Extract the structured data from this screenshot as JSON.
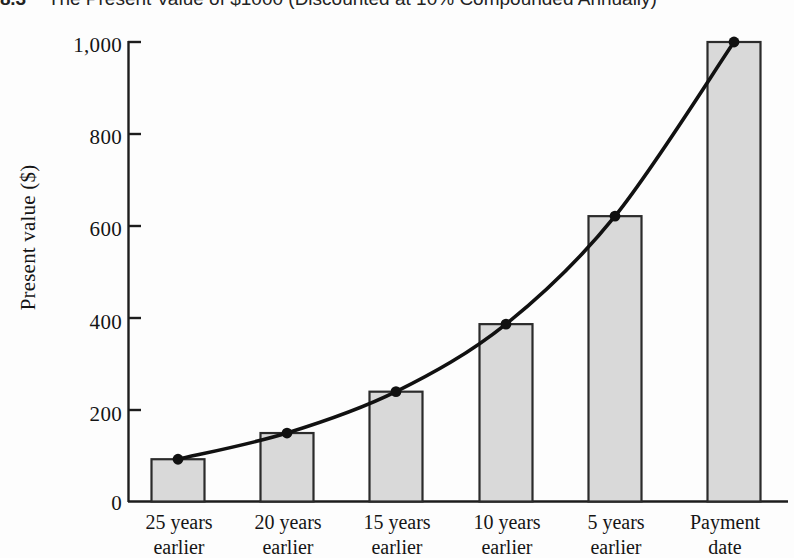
{
  "figure": {
    "number": "8.3",
    "caption": "The Present Value of $1000 (Discounted at 10% Compounded Annually)"
  },
  "chart_data": {
    "type": "bar",
    "title": "The Present Value of $1000 (Discounted at 10% Compounded Annually)",
    "xlabel": "",
    "ylabel": "Present value ($)",
    "ylim": [
      0,
      1000
    ],
    "yticks": [
      "0",
      "200",
      "400",
      "600",
      "800",
      "1,000"
    ],
    "ytick_values": [
      0,
      200,
      400,
      600,
      800,
      1000
    ],
    "grid": false,
    "legend": null,
    "categories": [
      "25 years earlier",
      "20 years earlier",
      "15 years earlier",
      "10 years earlier",
      "5 years earlier",
      "Payment date"
    ],
    "category_lines": [
      [
        "25 years",
        "earlier"
      ],
      [
        "20 years",
        "earlier"
      ],
      [
        "15 years",
        "earlier"
      ],
      [
        "10 years",
        "earlier"
      ],
      [
        "5 years",
        "earlier"
      ],
      [
        "Payment",
        "date"
      ]
    ],
    "values": [
      92,
      149,
      239,
      386,
      621,
      1000
    ],
    "series": [
      {
        "name": "Present value",
        "values": [
          92,
          149,
          239,
          386,
          621,
          1000
        ]
      },
      {
        "name": "Discount curve",
        "type": "line",
        "values": [
          92,
          149,
          239,
          386,
          621,
          1000
        ],
        "markers": "filled-circle"
      }
    ],
    "colors": {
      "bar_fill": "#d9d9d9",
      "bar_stroke": "#2b2b2b",
      "curve": "#111111",
      "marker": "#111111",
      "axis": "#1d1d1d",
      "background": "#fdfdfd"
    }
  }
}
